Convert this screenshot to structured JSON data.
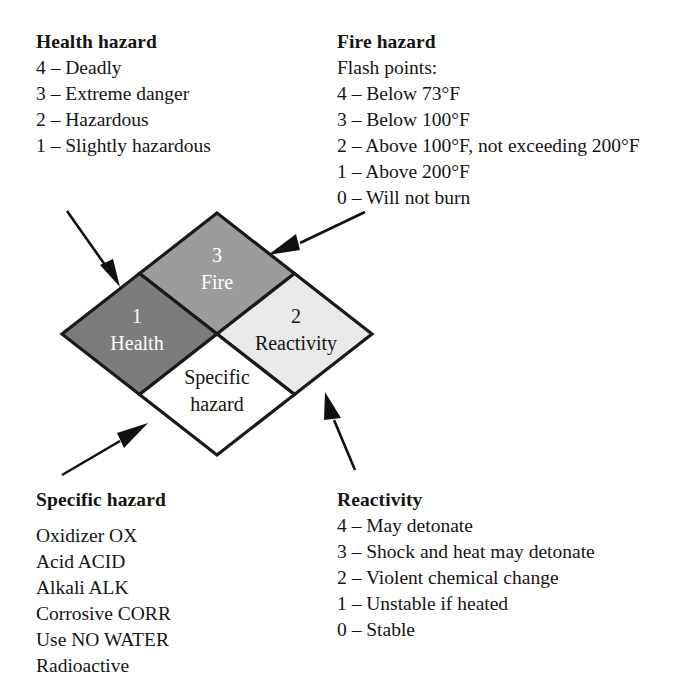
{
  "diagram": {
    "colors": {
      "health_fill": "#7c7c7c",
      "fire_fill": "#9c9c9c",
      "reactivity_fill": "#e9e9e9",
      "specific_fill": "#ffffff",
      "stroke": "#1a1a1a",
      "light_text": "#ffffff",
      "dark_text": "#141414"
    },
    "quadrants": {
      "health": {
        "rating": "1",
        "label": "Health"
      },
      "fire": {
        "rating": "3",
        "label": "Fire"
      },
      "reactivity": {
        "rating": "2",
        "label": "Reactivity"
      },
      "specific": {
        "label_line1": "Specific",
        "label_line2": "hazard"
      }
    }
  },
  "health_hazard": {
    "heading": "Health hazard",
    "lines": [
      "4 – Deadly",
      "3 – Extreme danger",
      "2 – Hazardous",
      "1 – Slightly hazardous"
    ]
  },
  "fire_hazard": {
    "heading": "Fire hazard",
    "lines": [
      "Flash points:",
      "4 – Below 73°F",
      "3 – Below 100°F",
      "2 – Above 100°F, not exceeding 200°F",
      "1 – Above 200°F",
      "0 – Will not burn"
    ]
  },
  "specific_hazard": {
    "heading": "Specific hazard",
    "lines": [
      "Oxidizer OX",
      "Acid ACID",
      "Alkali ALK",
      "Corrosive CORR",
      "Use NO WATER",
      "Radioactive"
    ]
  },
  "reactivity": {
    "heading": "Reactivity",
    "lines": [
      "4 – May detonate",
      "3 – Shock and heat may detonate",
      "2 – Violent chemical change",
      "1 – Unstable if heated",
      "0 – Stable"
    ]
  },
  "arrows": [
    {
      "name": "arrow-to-health",
      "points_to": "health"
    },
    {
      "name": "arrow-to-fire",
      "points_to": "fire"
    },
    {
      "name": "arrow-to-specific-hazard",
      "points_to": "specific"
    },
    {
      "name": "arrow-to-reactivity",
      "points_to": "reactivity"
    }
  ]
}
